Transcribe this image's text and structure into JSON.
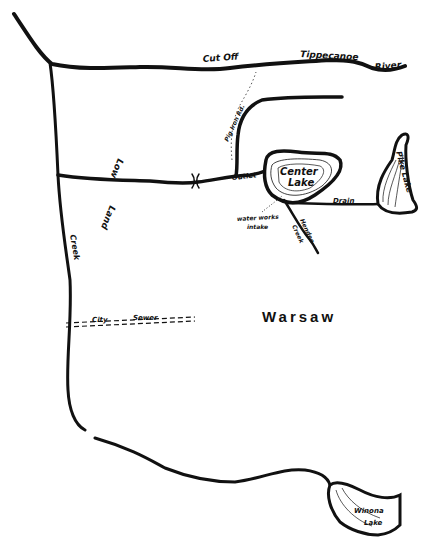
{
  "map": {
    "labels": {
      "cut_off": "Cut Off",
      "tippecanoe": "Tippecanoe",
      "river": "River",
      "road": "Pig Iron Rd.",
      "low": "Low",
      "land": "Land",
      "outlet": "Outlet",
      "center_lake_1": "Center",
      "center_lake_2": "Lake",
      "water_works_1": "water works",
      "water_works_2": "intake",
      "hendee_creek_1": "Hendee",
      "hendee_creek_2": "Creek",
      "drain": "Drain",
      "pike_lake": "Pike Lake",
      "creek": "Creek",
      "city": "City",
      "sewer": "Sewer",
      "warsaw": "Warsaw",
      "winona_1": "Winona",
      "winona_2": "Lake"
    },
    "colors": {
      "ink": "#111111",
      "paper": "#ffffff"
    }
  }
}
